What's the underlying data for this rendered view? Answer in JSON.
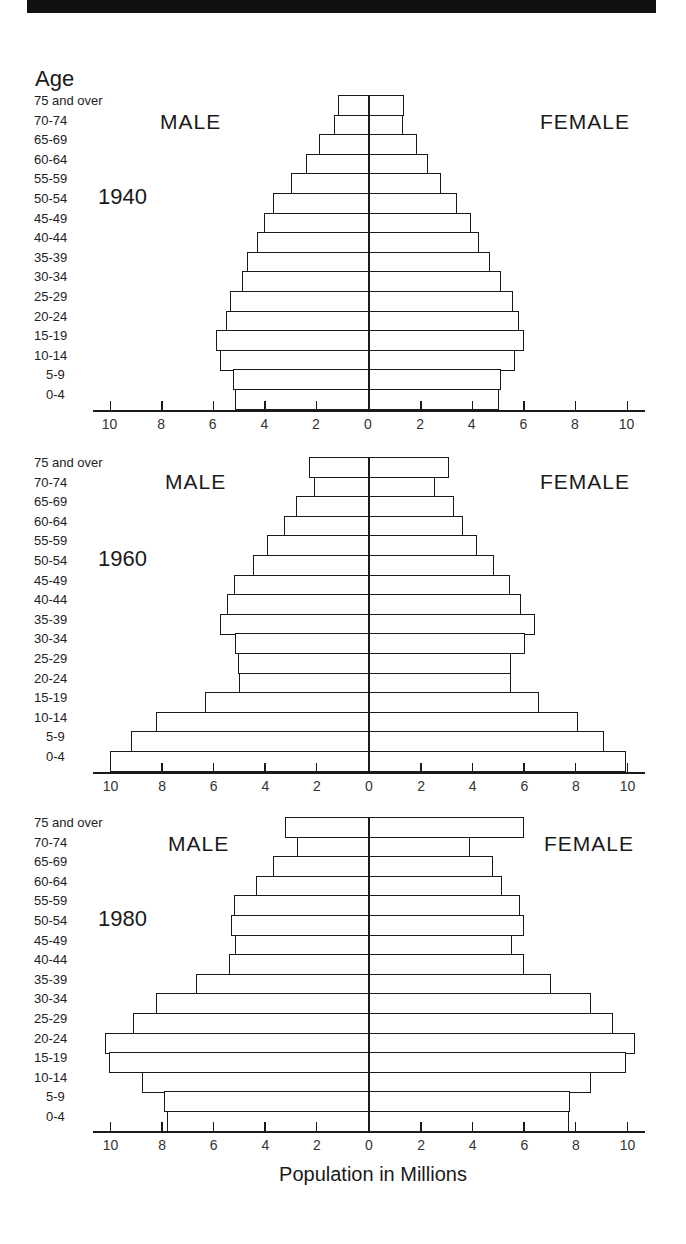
{
  "header": {
    "age_title": "Age"
  },
  "labels": {
    "male": "MALE",
    "female": "FEMALE",
    "xlabel": "Population in Millions"
  },
  "age_groups": [
    "75 and over",
    "70-74",
    "65-69",
    "60-64",
    "55-59",
    "50-54",
    "45-49",
    "40-44",
    "35-39",
    "30-34",
    "25-29",
    "20-24",
    "15-19",
    "10-14",
    "5-9",
    "0-4"
  ],
  "tick_labels": [
    "10",
    "8",
    "6",
    "4",
    "2",
    "0",
    "2",
    "4",
    "6",
    "8",
    "10"
  ],
  "chart_data": [
    {
      "type": "bar",
      "subtype": "population-pyramid",
      "title": "1940",
      "categories": [
        "75 and over",
        "70-74",
        "65-69",
        "60-64",
        "55-59",
        "50-54",
        "45-49",
        "40-44",
        "35-39",
        "30-34",
        "25-29",
        "20-24",
        "15-19",
        "10-14",
        "5-9",
        "0-4"
      ],
      "series": [
        {
          "name": "MALE",
          "values": [
            1.15,
            1.3,
            1.9,
            2.4,
            3.0,
            3.7,
            4.05,
            4.3,
            4.7,
            4.9,
            5.35,
            5.5,
            5.9,
            5.75,
            5.25,
            5.15
          ]
        },
        {
          "name": "FEMALE",
          "values": [
            1.35,
            1.3,
            1.85,
            2.3,
            2.8,
            3.4,
            3.95,
            4.25,
            4.7,
            5.1,
            5.6,
            5.8,
            6.0,
            5.65,
            5.1,
            5.05
          ]
        }
      ],
      "xlabel": "Population in Millions",
      "ylabel": "Age",
      "xlim": [
        -10,
        10
      ],
      "xticks": [
        10,
        8,
        6,
        4,
        2,
        0,
        2,
        4,
        6,
        8,
        10
      ],
      "grid": false
    },
    {
      "type": "bar",
      "subtype": "population-pyramid",
      "title": "1960",
      "categories": [
        "75 and over",
        "70-74",
        "65-69",
        "60-64",
        "55-59",
        "50-54",
        "45-49",
        "40-44",
        "35-39",
        "30-34",
        "25-29",
        "20-24",
        "15-19",
        "10-14",
        "5-9",
        "0-4"
      ],
      "series": [
        {
          "name": "MALE",
          "values": [
            2.3,
            2.1,
            2.8,
            3.25,
            3.9,
            4.45,
            5.2,
            5.45,
            5.75,
            5.15,
            5.05,
            5.0,
            6.3,
            8.2,
            9.2,
            10.0
          ]
        },
        {
          "name": "FEMALE",
          "values": [
            3.1,
            2.55,
            3.3,
            3.65,
            4.2,
            4.85,
            5.45,
            5.9,
            6.45,
            6.05,
            5.5,
            5.5,
            6.6,
            8.1,
            9.1,
            9.95
          ]
        }
      ],
      "xlabel": "Population in Millions",
      "ylabel": "Age",
      "xlim": [
        -10,
        10
      ],
      "xticks": [
        10,
        8,
        6,
        4,
        2,
        0,
        2,
        4,
        6,
        8,
        10
      ],
      "grid": false
    },
    {
      "type": "bar",
      "subtype": "population-pyramid",
      "title": "1980",
      "categories": [
        "75 and over",
        "70-74",
        "65-69",
        "60-64",
        "55-59",
        "50-54",
        "45-49",
        "40-44",
        "35-39",
        "30-34",
        "25-29",
        "20-24",
        "15-19",
        "10-14",
        "5-9",
        "0-4"
      ],
      "series": [
        {
          "name": "MALE",
          "values": [
            3.2,
            2.75,
            3.7,
            4.35,
            5.2,
            5.3,
            5.15,
            5.4,
            6.65,
            8.2,
            9.1,
            10.2,
            10.05,
            8.75,
            7.9,
            7.8
          ]
        },
        {
          "name": "FEMALE",
          "values": [
            6.0,
            3.9,
            4.8,
            5.15,
            5.85,
            6.0,
            5.55,
            6.0,
            7.05,
            8.6,
            9.45,
            10.3,
            9.95,
            8.6,
            7.8,
            7.75
          ]
        }
      ],
      "xlabel": "Population in Millions",
      "ylabel": "Age",
      "xlim": [
        -10,
        10
      ],
      "xticks": [
        10,
        8,
        6,
        4,
        2,
        0,
        2,
        4,
        6,
        8,
        10
      ],
      "grid": false
    }
  ]
}
